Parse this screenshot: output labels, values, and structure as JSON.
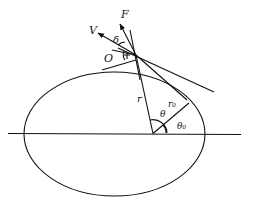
{
  "diagram": {
    "labels": {
      "V": "V",
      "F": "F",
      "delta": "δ",
      "O": "O",
      "r": "r",
      "r0": "r₀",
      "theta": "θ",
      "theta0": "θ₀"
    },
    "colors": {
      "stroke": "#111111",
      "background": "#ffffff"
    }
  }
}
